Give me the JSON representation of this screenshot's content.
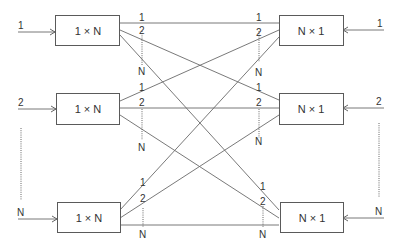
{
  "diagram": {
    "type": "crossconnect",
    "splitters": [
      {
        "id": "s1",
        "label": "1 × N",
        "input_label": "1"
      },
      {
        "id": "s2",
        "label": "1 × N",
        "input_label": "2"
      },
      {
        "id": "s3",
        "label": "1 × N",
        "input_label": "N"
      }
    ],
    "combiners": [
      {
        "id": "c1",
        "label": "N × 1",
        "input_label": "1"
      },
      {
        "id": "c2",
        "label": "N × 1",
        "input_label": "2"
      },
      {
        "id": "c3",
        "label": "N × 1",
        "input_label": "N"
      }
    ],
    "port_labels": {
      "p1": "1",
      "p2": "2",
      "pN": "N"
    },
    "connections": [
      {
        "from": "s1.1",
        "to": "c1.1"
      },
      {
        "from": "s1.2",
        "to": "c2.1"
      },
      {
        "from": "s1.N",
        "to": "c3.1"
      },
      {
        "from": "s2.1",
        "to": "c1.2"
      },
      {
        "from": "s2.2",
        "to": "c2.2"
      },
      {
        "from": "s2.N",
        "to": "c3.2"
      },
      {
        "from": "s3.1",
        "to": "c1.N"
      },
      {
        "from": "s3.2",
        "to": "c2.N"
      },
      {
        "from": "s3.N",
        "to": "c3.N"
      }
    ]
  }
}
